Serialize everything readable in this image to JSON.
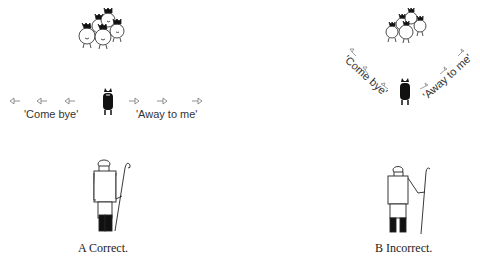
{
  "diagram": {
    "panels": [
      {
        "id": "A",
        "caption": "A  Correct.",
        "left_command": "'Come bye'",
        "right_command": "'Away to me'",
        "arrangement": "straight-line flank"
      },
      {
        "id": "B",
        "caption": "B  Incorrect.",
        "left_command": "'Come bye'",
        "right_command": "'Away to me'",
        "arrangement": "curved flank"
      }
    ],
    "elements": {
      "sheep_flock": "sheep-flock-icon",
      "dog": "sheepdog-icon",
      "shepherd": "shepherd-with-crook-icon",
      "arrows": "direction-arrow-icon"
    },
    "colors": {
      "ink": "#111111",
      "arrow": "#777777",
      "background": "#ffffff"
    }
  }
}
